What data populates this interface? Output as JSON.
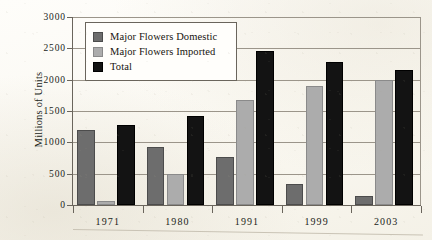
{
  "chart_data": {
    "type": "bar",
    "title": "",
    "xlabel": "",
    "ylabel": "Millions of Units",
    "categories": [
      "1971",
      "1980",
      "1991",
      "1999",
      "2003"
    ],
    "series": [
      {
        "name": "Major Flowers Domestic",
        "color": "#6d6d6d",
        "values": [
          1200,
          920,
          770,
          340,
          140
        ]
      },
      {
        "name": "Major Flowers Imported",
        "color": "#acacac",
        "values": [
          70,
          500,
          1680,
          1900,
          1990
        ]
      },
      {
        "name": "Total",
        "color": "#131313",
        "values": [
          1280,
          1420,
          2450,
          2280,
          2160
        ]
      }
    ],
    "ylim": [
      0,
      3000
    ],
    "ytick_labels": [
      "3000",
      "2500",
      "2000",
      "1500",
      "1000",
      "500",
      "0"
    ],
    "ytick_values": [
      3000,
      2500,
      2000,
      1500,
      1000,
      500,
      0
    ],
    "grid": true,
    "legend_position": "top-left"
  },
  "legend": {
    "entries": [
      {
        "label": "Major Flowers Domestic",
        "swatch": "domestic"
      },
      {
        "label": "Major Flowers Imported",
        "swatch": "imported"
      },
      {
        "label": "Total",
        "swatch": "total"
      }
    ]
  }
}
